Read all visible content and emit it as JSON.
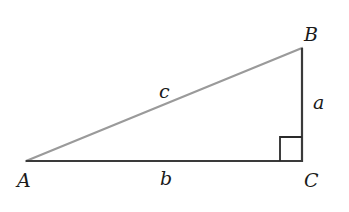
{
  "diagram": {
    "type": "right-triangle",
    "vertices": {
      "A": {
        "label": "A",
        "x": 26,
        "y": 161
      },
      "B": {
        "label": "B",
        "x": 302,
        "y": 48
      },
      "C": {
        "label": "C",
        "x": 302,
        "y": 161
      }
    },
    "sides": {
      "a": {
        "label": "a",
        "from": "B",
        "to": "C"
      },
      "b": {
        "label": "b",
        "from": "A",
        "to": "C"
      },
      "c": {
        "label": "c",
        "from": "A",
        "to": "B"
      }
    },
    "right_angle_at": "C",
    "colors": {
      "hypotenuse": "#9a9a9a",
      "legs": "#3a3a3a",
      "right_angle_marker": "#2a2a2a",
      "labels": "#1a1a1a"
    }
  }
}
